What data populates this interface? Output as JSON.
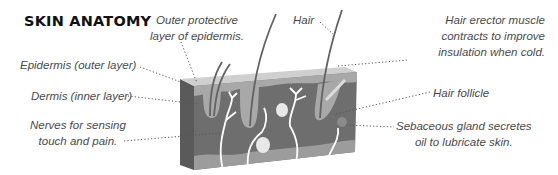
{
  "title": "SKIN ANATOMY",
  "labels": {
    "outer_protective": [
      "Outer protective",
      "layer of epidermis."
    ],
    "hair": "Hair",
    "hair_erector": [
      "Hair erector muscle",
      "contracts to improve",
      "insulation when cold."
    ],
    "epidermis": "Epidermis (outer layer)",
    "dermis": "Dermis (inner layer)",
    "hair_follicle": "Hair follicle",
    "nerves": [
      "Nerves for sensing",
      "touch and pain."
    ],
    "sebaceous": [
      "Sebaceous gland secretes",
      "oil to lubricate skin."
    ]
  },
  "colors": {
    "top_face": "#c8c8c8",
    "epidermis_band": "#a9a9a9",
    "dermis": "#6f6f6f",
    "side_face": "#5a5a5a",
    "bottom_band": "#9c9c9c",
    "nerve": "#ffffff",
    "hair": "#5f5f5f",
    "label_text": "#4a4a4a",
    "leader_line": "#555555"
  }
}
